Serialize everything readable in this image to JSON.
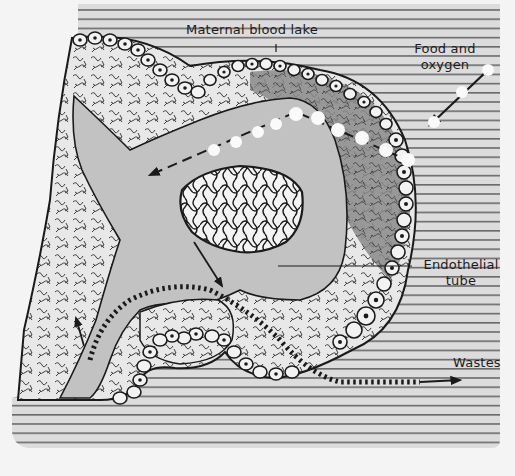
{
  "figure": {
    "type": "biological-diagram",
    "colors": {
      "paper": "#f4f4f4",
      "stripe_bg": "#dcdcdc",
      "stripe_line": "#6a6a6a",
      "tube_fill": "#c2c2c2",
      "mesenchyme": "#e6e6e6",
      "dark_mesenchyme": "#8e8e8e",
      "ink": "#1a1a1a",
      "cell_fill": "#f2f2f2",
      "bubble": "#fafafa"
    }
  },
  "labels": {
    "maternal_blood_lake": "Maternal blood lake",
    "food_and_oxygen_line1": "Food and",
    "food_and_oxygen_line2": "oxygen",
    "endothelial_tube_line1": "Endothelial",
    "endothelial_tube_line2": "tube",
    "wastes": "Wastes"
  },
  "icons": {
    "food_arrow": "arrow-inward-with-bubbles",
    "waste_arrow": "dashed-arrow-outward",
    "flow_arrows": "blood-flow-arrows"
  }
}
